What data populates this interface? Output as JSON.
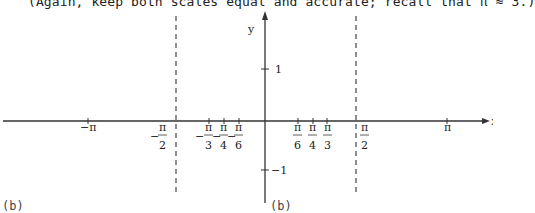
{
  "instruction": "(Again, keep both scales equal and accurate; recall that π ≈ 3.)",
  "axes": {
    "x_label": "x",
    "y_label": "y"
  },
  "x_ticks": [
    {
      "label": "−π",
      "num": "π",
      "den": "",
      "neg": true
    },
    {
      "label": "−π/2",
      "num": "π",
      "den": "2",
      "neg": true
    },
    {
      "label": "−π/3",
      "num": "π",
      "den": "3",
      "neg": true
    },
    {
      "label": "−π/4",
      "num": "π",
      "den": "4",
      "neg": true
    },
    {
      "label": "−π/6",
      "num": "π",
      "den": "6",
      "neg": true
    },
    {
      "label": "π/6",
      "num": "π",
      "den": "6",
      "neg": false
    },
    {
      "label": "π/4",
      "num": "π",
      "den": "4",
      "neg": false
    },
    {
      "label": "π/3",
      "num": "π",
      "den": "3",
      "neg": false
    },
    {
      "label": "π/2",
      "num": "π",
      "den": "2",
      "neg": false
    },
    {
      "label": "π",
      "num": "π",
      "den": "",
      "neg": false
    }
  ],
  "y_ticks": [
    {
      "label": "1"
    },
    {
      "label": "−1"
    }
  ],
  "asymptotes": [
    "x = −π/2",
    "x = π/2"
  ],
  "bottom_fragments": [
    "(b)",
    "(b)"
  ],
  "labels": {
    "neg_pi": "−π",
    "pi": "π",
    "minus": "−",
    "pi_sym": "π",
    "d2": "2",
    "d3": "3",
    "d4": "4",
    "d6": "6",
    "one": "1",
    "neg_one": "−1"
  }
}
